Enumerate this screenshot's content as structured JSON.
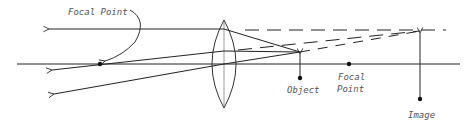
{
  "diagram": {
    "type": "converging-lens-virtual-image",
    "labels": {
      "focal_point_left": "Focal Point",
      "object": "Object",
      "focal_point_right_line1": "Focal",
      "focal_point_right_line2": "Point",
      "image": "Image"
    },
    "colors": {
      "stroke": "#222222",
      "text": "#555555",
      "background": "#ffffff"
    }
  }
}
